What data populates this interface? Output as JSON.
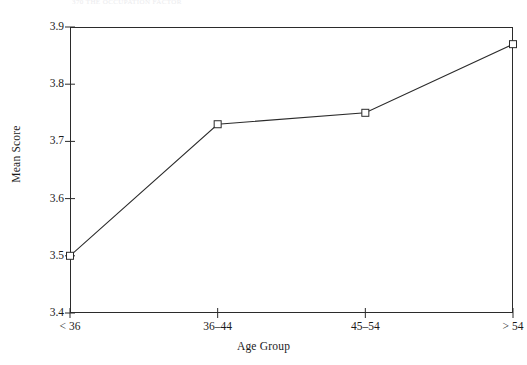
{
  "page_header_fragment": "370    THE OCCUPATION FACTOR",
  "chart_data": {
    "type": "line",
    "title": "",
    "xlabel": "Age Group",
    "ylabel": "Mean Score",
    "categories": [
      "< 36",
      "36–44",
      "45–54",
      "> 54"
    ],
    "values": [
      3.5,
      3.73,
      3.75,
      3.87
    ],
    "series": [
      {
        "name": "Mean Score",
        "values": [
          3.5,
          3.73,
          3.75,
          3.87
        ]
      }
    ],
    "ylim": [
      3.4,
      3.9
    ],
    "yticks": [
      "3.4",
      "3.5",
      "3.6",
      "3.7",
      "3.8",
      "3.9"
    ],
    "ytick_values": [
      3.4,
      3.5,
      3.6,
      3.7,
      3.8,
      3.9
    ],
    "grid": false,
    "legend": false,
    "legend_position": "none",
    "marker": "square-open",
    "line_color": "#2b2b2b",
    "marker_color": "#2b2b2b",
    "frame": true
  }
}
